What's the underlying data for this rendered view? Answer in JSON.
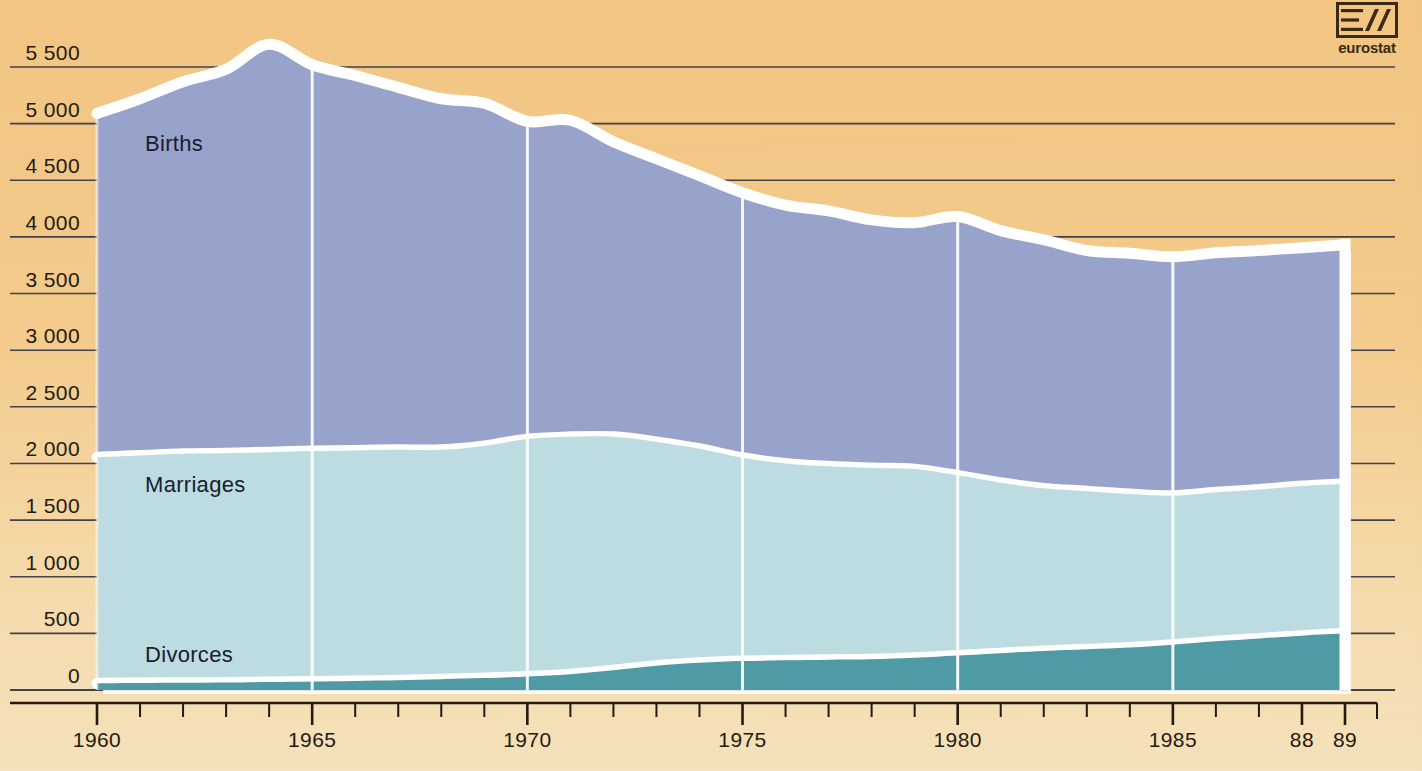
{
  "logo": {
    "name": "eurostat-logo",
    "word": "eurostat"
  },
  "axes": {
    "y_ticks": [
      "5 500",
      "5 000",
      "4 500",
      "4 000",
      "3 500",
      "3 000",
      "2 500",
      "2 000",
      "1 500",
      "1 000",
      "500",
      "0"
    ],
    "y_values": [
      5500,
      5000,
      4500,
      4000,
      3500,
      3000,
      2500,
      2000,
      1500,
      1000,
      500,
      0
    ],
    "x_ticks": [
      "1960",
      "1965",
      "1970",
      "1975",
      "1980",
      "1985",
      "88",
      "89"
    ],
    "x_tick_years": [
      1960,
      1965,
      1970,
      1975,
      1980,
      1985,
      1988,
      1989
    ]
  },
  "series_labels": {
    "births": "Births",
    "marriages": "Marriages",
    "divorces": "Divorces"
  },
  "colors": {
    "background": "#f4c57e",
    "births": "#97a3cb",
    "marriages": "#bcdce2",
    "divorces": "#4f9ba5",
    "separator": "#ffffff",
    "gridline": "#3a3a48",
    "text": "#241a10"
  },
  "chart_data": {
    "type": "area",
    "stacked": true,
    "title": "",
    "xlabel": "",
    "ylabel": "",
    "ylim": [
      0,
      5750
    ],
    "xlim": [
      1960,
      1989
    ],
    "grid": true,
    "legend": "inline-labels",
    "x": [
      1960,
      1961,
      1962,
      1963,
      1964,
      1965,
      1966,
      1967,
      1968,
      1969,
      1970,
      1971,
      1972,
      1973,
      1974,
      1975,
      1976,
      1977,
      1978,
      1979,
      1980,
      1981,
      1982,
      1983,
      1984,
      1985,
      1986,
      1987,
      1988,
      1989
    ],
    "series": [
      {
        "name": "Divorces",
        "values": [
          60,
          62,
          64,
          66,
          70,
          75,
          80,
          86,
          95,
          105,
          120,
          140,
          175,
          215,
          240,
          255,
          262,
          268,
          272,
          285,
          305,
          325,
          345,
          360,
          375,
          400,
          430,
          455,
          480,
          500
        ]
      },
      {
        "name": "Marriages",
        "values": [
          2055,
          2070,
          2085,
          2090,
          2100,
          2110,
          2115,
          2120,
          2120,
          2155,
          2215,
          2235,
          2235,
          2190,
          2130,
          2050,
          2000,
          1975,
          1960,
          1950,
          1895,
          1830,
          1780,
          1755,
          1730,
          1715,
          1745,
          1770,
          1800,
          1820
        ]
      },
      {
        "name": "Births",
        "values": [
          5090,
          5220,
          5370,
          5480,
          5700,
          5520,
          5425,
          5320,
          5220,
          5180,
          5020,
          5030,
          4840,
          4690,
          4540,
          4390,
          4280,
          4230,
          4150,
          4125,
          4180,
          4055,
          3975,
          3880,
          3855,
          3825,
          3860,
          3880,
          3905,
          3930
        ]
      }
    ],
    "series_note": "values are absolute totals (thousands); bands are drawn stacked: divorces at base, marriages next, births top band reaching the stated total"
  }
}
